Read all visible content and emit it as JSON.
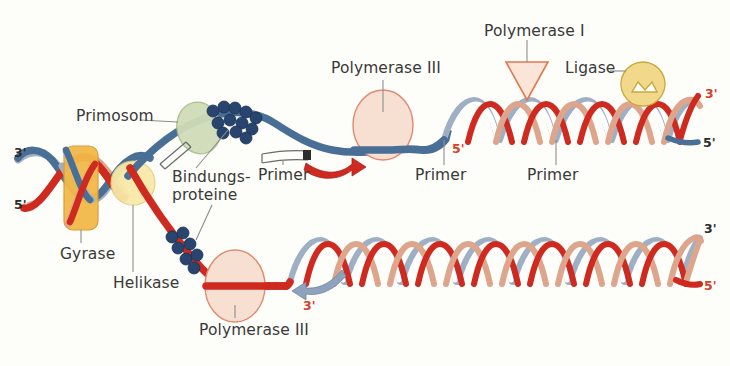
{
  "figure": {
    "background_color": "#fdfdfa",
    "language": "de"
  },
  "palette": {
    "template_blue": "#4a6f96",
    "template_blue_light": "#9fb0c4",
    "new_strand_red": "#cf2a20",
    "new_strand_salmon": "#dda58c",
    "gyrase_orange": "#f2b94a",
    "helicase_yellow": "#f7e9a8",
    "primosome_green": "#cfdcb8",
    "binding_protein_navy": "#28456f",
    "polymerase_peach": "#f7e0d2",
    "polymerase_outline": "#e08a70",
    "ligase_yellow": "#f2d88a",
    "label_gray": "#3a3a38",
    "leader_line_gray": "#8d8d8a",
    "red_label": "#d8402c"
  },
  "labels": [
    {
      "id": "primosom",
      "text": "Primosom",
      "x": 76,
      "y": 114
    },
    {
      "id": "bindungs1",
      "text": "Bindungs-",
      "x": 172,
      "y": 176
    },
    {
      "id": "bindungs2",
      "text": "proteine",
      "x": 172,
      "y": 194
    },
    {
      "id": "gyrase",
      "text": "Gyrase",
      "x": 60,
      "y": 252
    },
    {
      "id": "helikase",
      "text": "Helikase",
      "x": 113,
      "y": 281
    },
    {
      "id": "primer-1",
      "text": "Primer",
      "x": 266,
      "y": 173
    },
    {
      "id": "polymerase3-top",
      "text": "Polymerase III",
      "x": 331,
      "y": 66
    },
    {
      "id": "primer-2",
      "text": "Primer",
      "x": 415,
      "y": 173
    },
    {
      "id": "primer-3",
      "text": "Primer",
      "x": 527,
      "y": 173
    },
    {
      "id": "polymerase1",
      "text": "Polymerase I",
      "x": 484,
      "y": 29
    },
    {
      "id": "ligase",
      "text": "Ligase",
      "x": 565,
      "y": 66
    },
    {
      "id": "polymerase3-bottom",
      "text": "Polymerase III",
      "x": 199,
      "y": 328
    }
  ],
  "end_markers": [
    {
      "id": "left-top-3prime",
      "text": "3'",
      "x": 14,
      "y": 152,
      "color": "black"
    },
    {
      "id": "left-bottom-5prime",
      "text": "5'",
      "x": 14,
      "y": 204,
      "color": "black"
    },
    {
      "id": "lagging-primer-5prime",
      "text": "5'",
      "x": 452,
      "y": 148,
      "color": "red"
    },
    {
      "id": "right-top-3prime",
      "text": "3'",
      "x": 705,
      "y": 93,
      "color": "red"
    },
    {
      "id": "right-top-5prime",
      "text": "5'",
      "x": 703,
      "y": 142,
      "color": "black"
    },
    {
      "id": "leading-arrow-3prime",
      "text": "3'",
      "x": 303,
      "y": 305,
      "color": "red"
    },
    {
      "id": "right-bottom-3prime",
      "text": "3'",
      "x": 704,
      "y": 228,
      "color": "black"
    },
    {
      "id": "right-bottom-5prime",
      "text": "5'",
      "x": 704,
      "y": 285,
      "color": "red"
    }
  ],
  "components": [
    {
      "id": "gyrase-box",
      "name": "Gyrase",
      "shape": "rounded-rect",
      "color": "#f2b94a"
    },
    {
      "id": "helicase-circle",
      "name": "Helikase",
      "shape": "circle",
      "color": "#f7e9a8"
    },
    {
      "id": "primosome-ellipse",
      "name": "Primosom",
      "shape": "ellipse",
      "color": "#cfdcb8"
    },
    {
      "id": "binding-proteins",
      "name": "Bindungsproteine",
      "shape": "bead-cluster",
      "color": "#28456f"
    },
    {
      "id": "polymerase3-top-oval",
      "name": "Polymerase III",
      "shape": "ellipse",
      "color": "#f7e0d2"
    },
    {
      "id": "polymerase3-bottom-oval",
      "name": "Polymerase III",
      "shape": "ellipse",
      "color": "#f7e0d2"
    },
    {
      "id": "polymerase1-triangle",
      "name": "Polymerase I",
      "shape": "triangle",
      "color": "#f7e0d2"
    },
    {
      "id": "ligase-shape",
      "name": "Ligase",
      "shape": "notched-circle",
      "color": "#f2d88a"
    }
  ],
  "arrows": [
    {
      "id": "lagging-synthesis-arrow",
      "direction": "right",
      "color": "#cf2a20",
      "meaning": "Okazaki fragment synthesis"
    },
    {
      "id": "leading-synthesis-arrow",
      "direction": "left",
      "color": "#8fa2bd",
      "meaning": "Leading strand synthesis"
    }
  ]
}
